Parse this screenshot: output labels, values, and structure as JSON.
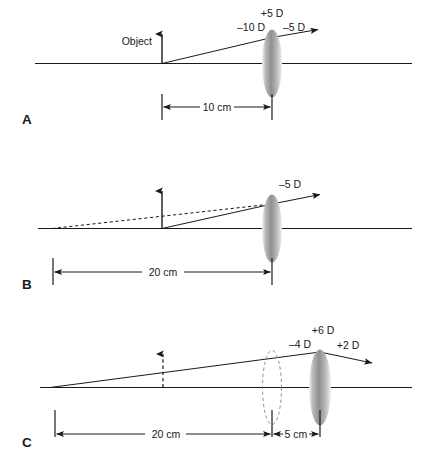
{
  "figure": {
    "type": "optics-ray-diagram",
    "background_color": "#ffffff",
    "line_color": "#1a1a1a",
    "lens_fill_dark": "#8d8d8d",
    "lens_fill_light": "#e8e8e8"
  },
  "panels": [
    {
      "id": "A",
      "letter": "A",
      "object_label": "Object",
      "object_arrow_style": "solid",
      "lens": {
        "style": "solid",
        "power_label": "+5 D"
      },
      "vergence_in": "–10 D",
      "vergence_out": "–5 D",
      "dimensions": [
        {
          "label": "10 cm"
        }
      ]
    },
    {
      "id": "B",
      "letter": "B",
      "object_label": "",
      "object_arrow_style": "solid",
      "lens": {
        "style": "solid",
        "power_label": ""
      },
      "vergence_in": "",
      "vergence_out": "–5 D",
      "dimensions": [
        {
          "label": "20 cm"
        }
      ]
    },
    {
      "id": "C",
      "letter": "C",
      "object_label": "",
      "object_arrow_style": "dashed",
      "lens": {
        "style": "solid",
        "power_label": "+6 D"
      },
      "virtual_lens": {
        "style": "dashed"
      },
      "vergence_in": "–4 D",
      "vergence_out": "+2 D",
      "dimensions": [
        {
          "label": "20 cm"
        },
        {
          "label": "5 cm"
        }
      ]
    }
  ],
  "labels": {
    "a_power": "+5 D",
    "a_in": "–10 D",
    "a_out": "–5 D",
    "a_object": "Object",
    "a_dim1": "10 cm",
    "a_letter": "A",
    "b_out": "–5 D",
    "b_dim1": "20 cm",
    "b_letter": "B",
    "c_power": "+6 D",
    "c_in": "–4 D",
    "c_out": "+2 D",
    "c_dim1": "20 cm",
    "c_dim2": "5 cm",
    "c_letter": "C"
  }
}
